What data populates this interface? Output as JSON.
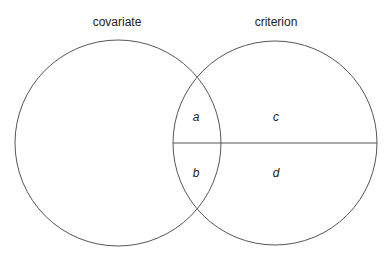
{
  "diagram": {
    "type": "venn",
    "circles": [
      {
        "label": "covariate",
        "cx": 118,
        "cy": 143,
        "r": 103
      },
      {
        "label": "criterion",
        "cx": 275,
        "cy": 143,
        "r": 102
      }
    ],
    "divider": {
      "y": 143,
      "x1": 173,
      "x2": 377
    },
    "regions": [
      {
        "label": "a",
        "x": 196,
        "y": 117
      },
      {
        "label": "b",
        "x": 196,
        "y": 173
      },
      {
        "label": "c",
        "x": 275,
        "y": 117
      },
      {
        "label": "d",
        "x": 275,
        "y": 173
      }
    ],
    "stroke_color": "#555555"
  }
}
